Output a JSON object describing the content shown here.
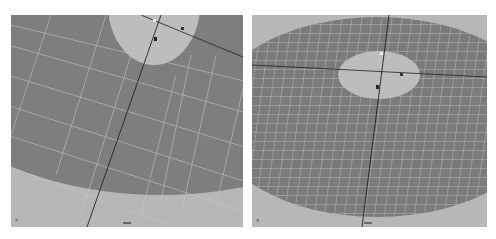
{
  "viewports": [
    {
      "id": "viewport-left",
      "view": "close-up perspective",
      "axis_indicator": "z",
      "colors": {
        "background": "#b7b7b7",
        "disc": "#7e7e7e",
        "grid": "#c9c9c9",
        "hole": "#bdbdbd",
        "axis": "#222222"
      }
    },
    {
      "id": "viewport-right",
      "view": "wide perspective",
      "axis_indicator": "z",
      "colors": {
        "background": "#b7b7b7",
        "disc": "#7b7b7b",
        "grid": "#c4c4c4",
        "hole": "#bdbdbd",
        "axis": "#222222"
      }
    }
  ]
}
